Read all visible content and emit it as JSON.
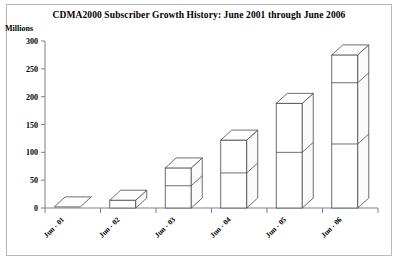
{
  "chart_data": {
    "type": "bar",
    "title": "CDMA2000 Subscriber Growth History: June 2001 through June 2006",
    "ylabel": "Millions",
    "xlabel": "",
    "categories": [
      "Jun - 01",
      "Jun - 02",
      "Jun - 03",
      "Jun - 04",
      "Jun - 05",
      "Jun - 06"
    ],
    "values": [
      2,
      14,
      72,
      122,
      188,
      275
    ],
    "series": [
      {
        "name": "CDMA2000 Subscribers",
        "values": [
          2,
          14,
          72,
          122,
          188,
          275
        ]
      }
    ],
    "segment_boundaries": [
      [],
      [],
      [
        40
      ],
      [
        63
      ],
      [
        100
      ],
      [
        115,
        225
      ]
    ],
    "ylim": [
      0,
      300
    ],
    "yticks": [
      0,
      50,
      100,
      150,
      200,
      250,
      300
    ],
    "ytick_labels": [
      "0",
      "50",
      "100",
      "150",
      "200",
      "250",
      "300"
    ],
    "grid": false,
    "legend": "none",
    "style": "3d-isometric-bars",
    "bar_fill": "#ffffff",
    "bar_stroke": "#4a4a4a",
    "axis_color": "#808080",
    "frame_color": "#b9b9b9",
    "background": "#ffffff"
  }
}
